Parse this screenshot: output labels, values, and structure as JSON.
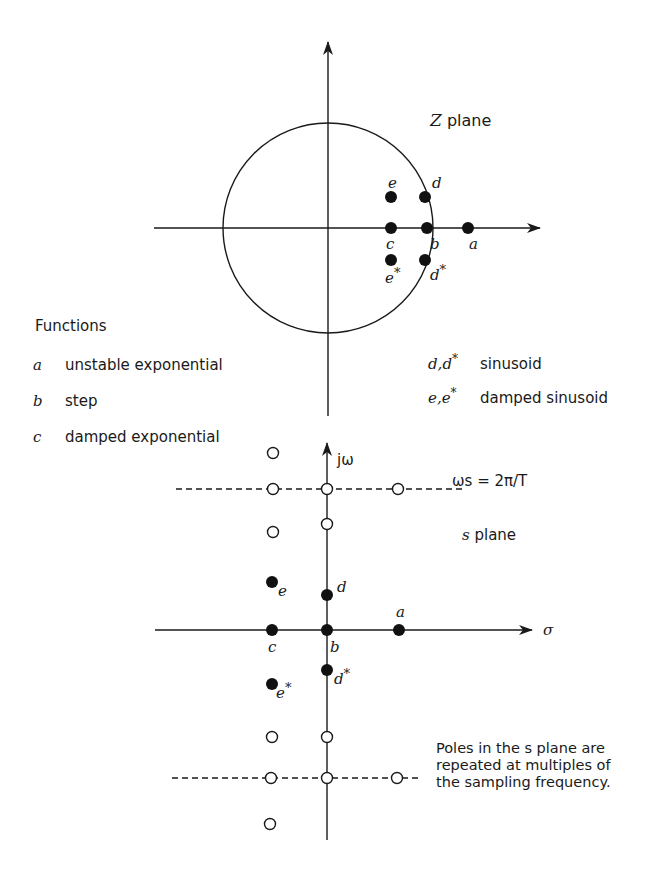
{
  "z_plane": {
    "title": "Z plane",
    "unit_circle": {
      "cx": 328,
      "cy": 228,
      "r": 105
    },
    "axes": {
      "horizontal": {
        "x1": 154,
        "x2": 540,
        "y": 228
      },
      "vertical": {
        "x": 328,
        "y1": 42,
        "y2": 416
      }
    },
    "poles": [
      {
        "label": "e",
        "x": 391,
        "y": 197,
        "lx": 388,
        "ly": 188
      },
      {
        "label": "d",
        "x": 425,
        "y": 197,
        "lx": 432,
        "ly": 188
      },
      {
        "label": "c",
        "x": 391,
        "y": 228,
        "lx": 386,
        "ly": 249
      },
      {
        "label": "b",
        "x": 427,
        "y": 228,
        "lx": 430,
        "ly": 249
      },
      {
        "label": "a",
        "x": 468,
        "y": 228,
        "lx": 469,
        "ly": 249
      },
      {
        "label": "e*",
        "x": 391,
        "y": 260,
        "lx": 385,
        "ly": 283
      },
      {
        "label": "d*",
        "x": 425,
        "y": 260,
        "lx": 430,
        "ly": 280
      }
    ]
  },
  "legend": {
    "heading": "Functions",
    "items": [
      {
        "key": "a",
        "desc": "unstable exponential"
      },
      {
        "key": "b",
        "desc": "step"
      },
      {
        "key": "c",
        "desc": "damped exponential"
      }
    ],
    "right_items": [
      {
        "key": "d,d*",
        "desc": "sinusoid"
      },
      {
        "key": "e,e*",
        "desc": "damped sinusoid"
      }
    ]
  },
  "s_plane": {
    "title": "s plane",
    "axis_label_vertical": "jω",
    "axis_label_horizontal": "σ",
    "sampling_label": "ωs = 2π/T",
    "note_lines": [
      "Poles in the s plane are",
      "repeated at multiples of",
      "the sampling frequency."
    ],
    "axes": {
      "horizontal": {
        "x1": 155,
        "x2": 532,
        "y": 630
      },
      "vertical": {
        "x": 327,
        "y1": 443,
        "y2": 840
      }
    },
    "dashed_lines": [
      {
        "x1": 176,
        "x2": 462,
        "y": 489
      },
      {
        "x1": 172,
        "x2": 420,
        "y": 778
      }
    ],
    "poles": [
      {
        "label": "e",
        "x": 272,
        "y": 582,
        "lx": 278,
        "ly": 596
      },
      {
        "label": "d",
        "x": 327,
        "y": 595,
        "lx": 337,
        "ly": 592
      },
      {
        "label": "a",
        "x": 399,
        "y": 630,
        "lx": 396,
        "ly": 617
      },
      {
        "label": "c",
        "x": 272,
        "y": 630,
        "lx": 268,
        "ly": 652
      },
      {
        "label": "b",
        "x": 327,
        "y": 630,
        "lx": 330,
        "ly": 652
      },
      {
        "label": "d*",
        "x": 327,
        "y": 670,
        "lx": 334,
        "ly": 684
      },
      {
        "label": "e*",
        "x": 272,
        "y": 684,
        "lx": 276,
        "ly": 698
      }
    ],
    "repeated_poles": [
      {
        "x": 273,
        "y": 453
      },
      {
        "x": 273,
        "y": 489
      },
      {
        "x": 327,
        "y": 489
      },
      {
        "x": 398,
        "y": 489
      },
      {
        "x": 327,
        "y": 524
      },
      {
        "x": 273,
        "y": 532
      },
      {
        "x": 272,
        "y": 737
      },
      {
        "x": 327,
        "y": 737
      },
      {
        "x": 271,
        "y": 778
      },
      {
        "x": 327,
        "y": 778
      },
      {
        "x": 397,
        "y": 778
      },
      {
        "x": 270,
        "y": 824
      }
    ]
  }
}
